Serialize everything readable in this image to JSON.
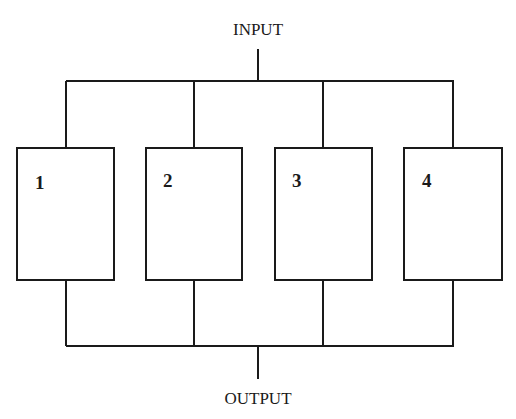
{
  "diagram": {
    "input_label": "INPUT",
    "output_label": "OUTPUT",
    "blocks": [
      {
        "label": "1"
      },
      {
        "label": "2"
      },
      {
        "label": "3"
      },
      {
        "label": "4"
      }
    ],
    "topology": "parallel",
    "line_color": "#1a1a1a"
  }
}
